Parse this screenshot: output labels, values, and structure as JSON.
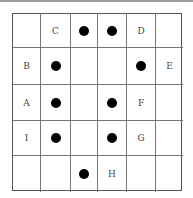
{
  "grid": {
    "rows": 5,
    "cols": 6,
    "cells": [
      [
        {
          "type": "empty"
        },
        {
          "type": "label",
          "text": "C"
        },
        {
          "type": "dot"
        },
        {
          "type": "dot"
        },
        {
          "type": "label",
          "text": "D"
        },
        {
          "type": "empty"
        }
      ],
      [
        {
          "type": "label",
          "text": "B"
        },
        {
          "type": "dot"
        },
        {
          "type": "empty"
        },
        {
          "type": "empty"
        },
        {
          "type": "dot"
        },
        {
          "type": "label",
          "text": "E"
        }
      ],
      [
        {
          "type": "label",
          "text": "A"
        },
        {
          "type": "dot"
        },
        {
          "type": "empty"
        },
        {
          "type": "dot"
        },
        {
          "type": "label",
          "text": "F"
        },
        {
          "type": "empty"
        }
      ],
      [
        {
          "type": "label",
          "text": "I"
        },
        {
          "type": "dot"
        },
        {
          "type": "empty"
        },
        {
          "type": "dot"
        },
        {
          "type": "label",
          "text": "G"
        },
        {
          "type": "empty"
        }
      ],
      [
        {
          "type": "empty"
        },
        {
          "type": "empty"
        },
        {
          "type": "dot"
        },
        {
          "type": "label",
          "text": "H"
        },
        {
          "type": "empty"
        },
        {
          "type": "empty"
        }
      ]
    ]
  },
  "labels": {
    "r0c1": "C",
    "r0c4": "D",
    "r1c0": "B",
    "r1c5": "E",
    "r2c0": "A",
    "r2c4": "F",
    "r3c0": "I",
    "r3c4": "G",
    "r4c3": "H"
  }
}
